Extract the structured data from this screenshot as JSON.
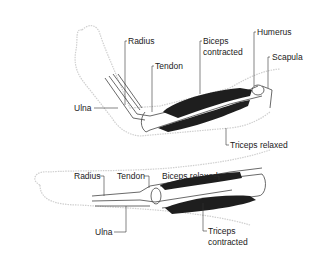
{
  "diagram": {
    "top_arm": {
      "state": "flexed",
      "labels": {
        "radius": "Radius",
        "tendon": "Tendon",
        "biceps_l1": "Biceps",
        "biceps_l2": "contracted",
        "humerus": "Humerus",
        "scapula": "Scapula",
        "ulna": "Ulna",
        "triceps": "Triceps relaxed"
      }
    },
    "bottom_arm": {
      "state": "extended",
      "labels": {
        "radius": "Radius",
        "tendon": "Tendon",
        "biceps": "Biceps relaxed",
        "ulna": "Ulna",
        "triceps_l1": "Triceps",
        "triceps_l2": "contracted"
      }
    },
    "colors": {
      "muscle": "#1e1e1e",
      "outline": "#555555",
      "skin": "#d6d6d6",
      "text": "#222222"
    }
  }
}
